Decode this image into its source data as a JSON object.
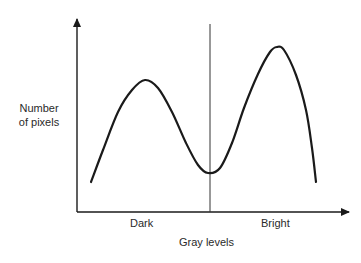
{
  "chart_data": {
    "type": "line",
    "title": "",
    "xlabel": "Gray levels",
    "ylabel": "Number of pixels",
    "ylabel_lines": [
      "Number",
      "of pixels"
    ],
    "region_labels": [
      "Dark",
      "Bright"
    ],
    "threshold_divider": "vertical line separating Dark and Bright at the valley",
    "x": [
      0.0,
      0.1,
      0.2,
      0.3,
      0.4,
      0.5,
      0.55,
      0.6,
      0.7,
      0.8,
      0.85,
      0.9,
      1.0
    ],
    "values": [
      0.18,
      0.55,
      0.8,
      0.68,
      0.32,
      0.2,
      0.21,
      0.35,
      0.78,
      0.99,
      1.0,
      0.85,
      0.18
    ],
    "grid": false,
    "axis_ticks": "none",
    "legend": "none",
    "curve_points_px": [
      [
        91,
        182
      ],
      [
        103,
        150
      ],
      [
        118,
        112
      ],
      [
        132,
        90
      ],
      [
        145,
        80
      ],
      [
        158,
        88
      ],
      [
        172,
        112
      ],
      [
        186,
        143
      ],
      [
        198,
        165
      ],
      [
        208,
        173
      ],
      [
        220,
        168
      ],
      [
        232,
        143
      ],
      [
        244,
        108
      ],
      [
        258,
        74
      ],
      [
        270,
        52
      ],
      [
        277,
        47
      ],
      [
        284,
        50
      ],
      [
        296,
        75
      ],
      [
        306,
        110
      ],
      [
        312,
        148
      ],
      [
        316,
        182
      ]
    ],
    "colors": {
      "curve": "#1a1a1a",
      "axes": "#1a1a1a",
      "divider": "#333333"
    }
  }
}
